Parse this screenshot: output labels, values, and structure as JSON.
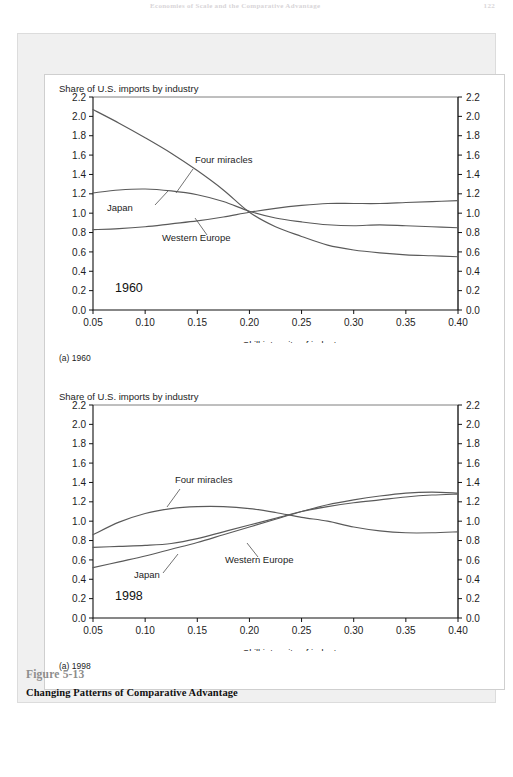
{
  "running_head": {
    "title": "Economies of Scale and the Comparative Advantage",
    "page_number": "122"
  },
  "figure": {
    "number": "Figure 5-13",
    "title": "Changing Patterns of Comparative Advantage"
  },
  "charts": [
    {
      "id": "chart-1960",
      "y_axis_label": "Share of U.S. imports by industry",
      "x_axis_label": "Skill intensity of industry",
      "year_badge": "1960",
      "subcaption": "(a) 1960",
      "y_ticks": [
        "0.0",
        "0.2",
        "0.4",
        "0.6",
        "0.8",
        "1.0",
        "1.2",
        "1.4",
        "1.6",
        "1.8",
        "2.0",
        "2.2"
      ],
      "x_ticks": [
        "0.05",
        "0.10",
        "0.15",
        "0.20",
        "0.25",
        "0.30",
        "0.35",
        "0.40"
      ],
      "series_labels": [
        "Four miracles",
        "Japan",
        "Western Europe"
      ]
    },
    {
      "id": "chart-1998",
      "y_axis_label": "Share of U.S. imports by industry",
      "x_axis_label": "Skill intensity of industry",
      "year_badge": "1998",
      "subcaption": "(a) 1998",
      "y_ticks": [
        "0.0",
        "0.2",
        "0.4",
        "0.6",
        "0.8",
        "1.0",
        "1.2",
        "1.4",
        "1.6",
        "1.8",
        "2.0",
        "2.2"
      ],
      "x_ticks": [
        "0.05",
        "0.10",
        "0.15",
        "0.20",
        "0.25",
        "0.30",
        "0.35",
        "0.40"
      ],
      "series_labels": [
        "Four miracles",
        "Japan",
        "Western Europe"
      ]
    }
  ],
  "colors": {
    "curve": "#5a5a5a",
    "axis": "#111111",
    "frame_bg": "#f0f0f0",
    "panel_bg": "#ffffff",
    "fig_num": "#8d8d8d"
  },
  "chart_data": [
    {
      "type": "line",
      "id": "chart-1960",
      "title": "(a) 1960",
      "xlabel": "Skill intensity of industry",
      "ylabel": "Share of U.S. imports by industry",
      "xlim": [
        0.05,
        0.4
      ],
      "ylim": [
        0.0,
        2.2
      ],
      "xticks": [
        0.05,
        0.1,
        0.15,
        0.2,
        0.25,
        0.3,
        0.35,
        0.4
      ],
      "yticks": [
        0.0,
        0.2,
        0.4,
        0.6,
        0.8,
        1.0,
        1.2,
        1.4,
        1.6,
        1.8,
        2.0,
        2.2
      ],
      "grid": false,
      "legend": "inline-annotations",
      "annotation": "1960",
      "x": [
        0.05,
        0.075,
        0.1,
        0.125,
        0.15,
        0.175,
        0.2,
        0.225,
        0.25,
        0.275,
        0.3,
        0.325,
        0.35,
        0.375,
        0.4
      ],
      "series": [
        {
          "name": "Four miracles",
          "values": [
            2.07,
            1.93,
            1.78,
            1.62,
            1.44,
            1.24,
            1.01,
            0.86,
            0.76,
            0.67,
            0.62,
            0.59,
            0.57,
            0.56,
            0.55
          ]
        },
        {
          "name": "Japan",
          "values": [
            1.21,
            1.24,
            1.25,
            1.23,
            1.19,
            1.12,
            1.02,
            0.95,
            0.91,
            0.88,
            0.87,
            0.88,
            0.87,
            0.86,
            0.85
          ]
        },
        {
          "name": "Western Europe",
          "values": [
            0.83,
            0.84,
            0.86,
            0.89,
            0.92,
            0.96,
            1.01,
            1.05,
            1.08,
            1.1,
            1.1,
            1.1,
            1.11,
            1.12,
            1.13
          ]
        }
      ]
    },
    {
      "type": "line",
      "id": "chart-1998",
      "title": "(a) 1998",
      "xlabel": "Skill intensity of industry",
      "ylabel": "Share of U.S. imports by industry",
      "xlim": [
        0.05,
        0.4
      ],
      "ylim": [
        0.0,
        2.2
      ],
      "xticks": [
        0.05,
        0.1,
        0.15,
        0.2,
        0.25,
        0.3,
        0.35,
        0.4
      ],
      "yticks": [
        0.0,
        0.2,
        0.4,
        0.6,
        0.8,
        1.0,
        1.2,
        1.4,
        1.6,
        1.8,
        2.0,
        2.2
      ],
      "grid": false,
      "legend": "inline-annotations",
      "annotation": "1998",
      "x": [
        0.05,
        0.075,
        0.1,
        0.125,
        0.15,
        0.175,
        0.2,
        0.225,
        0.25,
        0.275,
        0.3,
        0.325,
        0.35,
        0.375,
        0.4
      ],
      "series": [
        {
          "name": "Four miracles",
          "values": [
            0.86,
            0.99,
            1.08,
            1.13,
            1.15,
            1.15,
            1.13,
            1.09,
            1.04,
            1.0,
            0.94,
            0.9,
            0.88,
            0.88,
            0.89
          ]
        },
        {
          "name": "Japan",
          "values": [
            0.52,
            0.58,
            0.64,
            0.71,
            0.78,
            0.86,
            0.94,
            1.02,
            1.1,
            1.17,
            1.22,
            1.26,
            1.29,
            1.3,
            1.29
          ]
        },
        {
          "name": "Western Europe",
          "values": [
            0.73,
            0.74,
            0.75,
            0.77,
            0.82,
            0.89,
            0.96,
            1.03,
            1.1,
            1.15,
            1.19,
            1.22,
            1.25,
            1.27,
            1.28
          ]
        }
      ]
    }
  ]
}
